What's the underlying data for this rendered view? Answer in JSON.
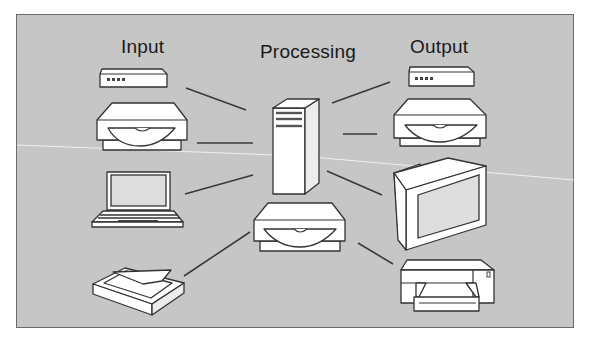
{
  "diagram": {
    "title_labels": {
      "input": "Input",
      "processing": "Processing",
      "output": "Output"
    },
    "colors": {
      "background": "#c6c6c6",
      "frame_border": "#6a6a6a",
      "device_fill": "#ffffff",
      "device_stroke": "#333333",
      "connector": "#3a3a3a"
    },
    "nodes": [
      {
        "id": "input-modem",
        "type": "modem",
        "group": "Input"
      },
      {
        "id": "input-disk-drive",
        "type": "disk-drive",
        "group": "Input"
      },
      {
        "id": "input-laptop",
        "type": "laptop",
        "group": "Input"
      },
      {
        "id": "input-scanner",
        "type": "scanner",
        "group": "Input"
      },
      {
        "id": "processing-server",
        "type": "tower-computer",
        "group": "Processing"
      },
      {
        "id": "processing-disk-drive",
        "type": "disk-drive",
        "group": "Processing"
      },
      {
        "id": "output-modem",
        "type": "modem",
        "group": "Output"
      },
      {
        "id": "output-disk-drive",
        "type": "disk-drive",
        "group": "Output"
      },
      {
        "id": "output-monitor",
        "type": "monitor",
        "group": "Output"
      },
      {
        "id": "output-printer",
        "type": "printer",
        "group": "Output"
      }
    ],
    "edges": [
      {
        "from": "input-modem",
        "to": "processing-server"
      },
      {
        "from": "input-disk-drive",
        "to": "processing-server"
      },
      {
        "from": "input-laptop",
        "to": "processing-server"
      },
      {
        "from": "input-scanner",
        "to": "processing-disk-drive"
      },
      {
        "from": "processing-server",
        "to": "output-modem"
      },
      {
        "from": "processing-server",
        "to": "output-disk-drive"
      },
      {
        "from": "processing-server",
        "to": "output-monitor"
      },
      {
        "from": "processing-disk-drive",
        "to": "output-printer"
      }
    ]
  }
}
